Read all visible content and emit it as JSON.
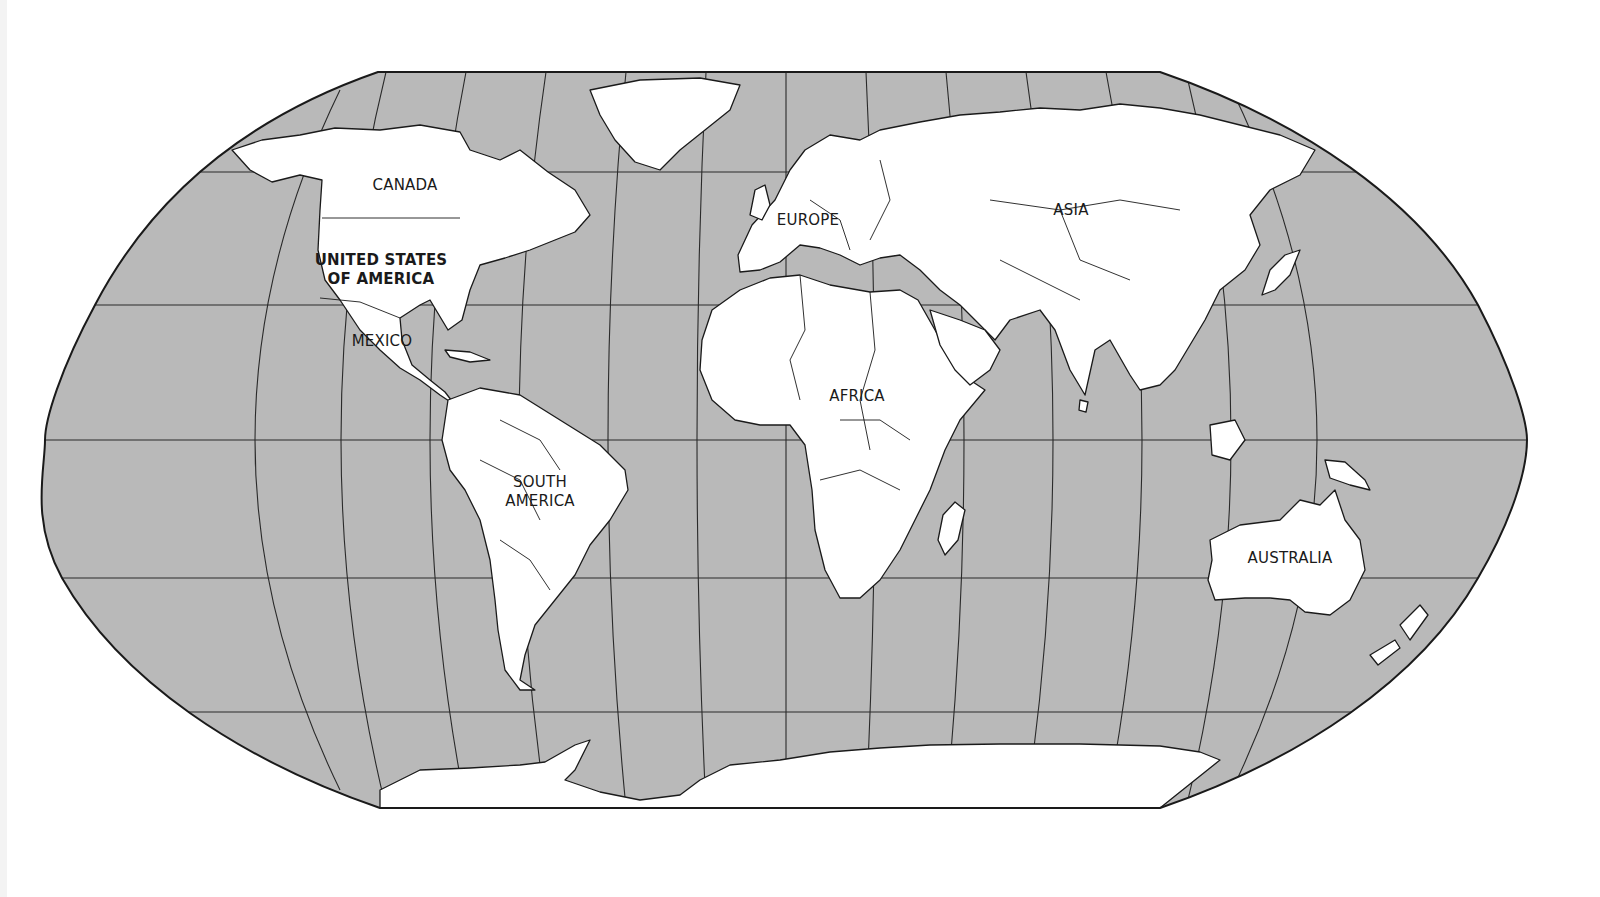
{
  "map": {
    "projection": "Robinson-style world map",
    "colors": {
      "ocean": "#b9b9b9",
      "land": "#ffffff",
      "outline": "#1a1a1a",
      "graticule": "#2a2a2a",
      "background": "#ffffff"
    },
    "labels": {
      "canada": "CANADA",
      "usa_line1": "UNITED STATES",
      "usa_line2": "OF AMERICA",
      "mexico": "MEXICO",
      "south_america_line1": "SOUTH",
      "south_america_line2": "AMERICA",
      "europe": "EUROPE",
      "africa": "AFRICA",
      "asia": "ASIA",
      "australia": "AUSTRALIA"
    }
  }
}
